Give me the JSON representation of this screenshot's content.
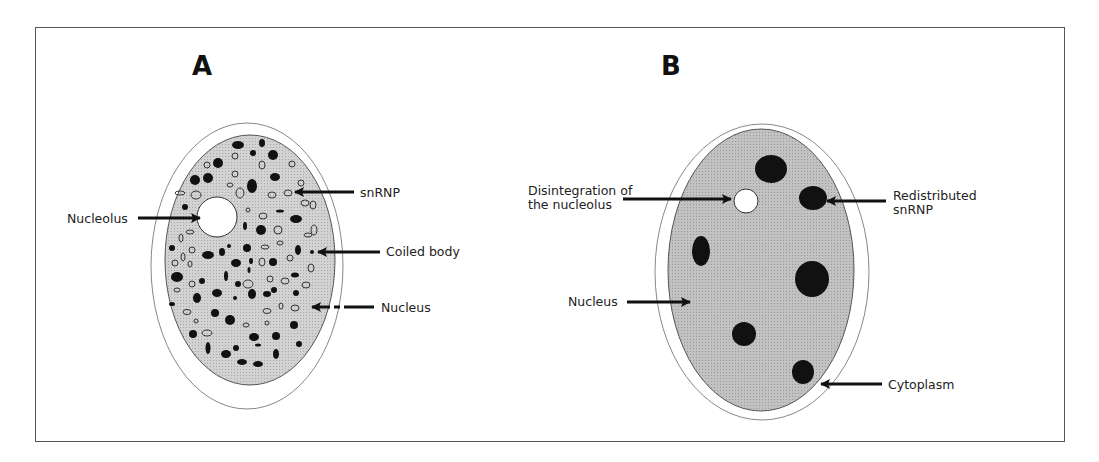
{
  "figure": {
    "panels": [
      {
        "letter": "A",
        "labels": {
          "nucleolus": "Nucleolus",
          "snrnp": "snRNP",
          "coiled_body": "Coiled body",
          "nucleus": "Nucleus"
        }
      },
      {
        "letter": "B",
        "labels": {
          "disintegration_line1": "Disintegration of",
          "disintegration_line2": "the nucleolus",
          "redistributed_line1": "Redistributed",
          "redistributed_line2": "snRNP",
          "nucleus": "Nucleus",
          "cytoplasm": "Cytoplasm"
        }
      }
    ],
    "colors": {
      "frame": "#555555",
      "nucleus_fill": "#c8c8c8",
      "nucleus_fill_B": "#bdbdbd",
      "particle": "#111111",
      "arrow": "#111111"
    }
  }
}
